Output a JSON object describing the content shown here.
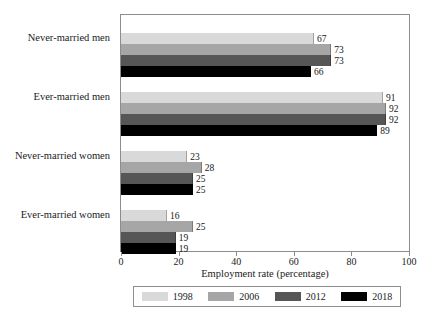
{
  "chart_data": {
    "type": "bar",
    "orientation": "horizontal",
    "title": "",
    "xlabel": "Employment rate (percentage)",
    "ylabel": "",
    "xlim": [
      0,
      100
    ],
    "xticks": [
      0,
      20,
      40,
      60,
      80,
      100
    ],
    "grid": false,
    "legend_position": "bottom",
    "categories": [
      "Never-married men",
      "Ever-married men",
      "Never-married women",
      "Ever-married women"
    ],
    "series": [
      {
        "name": "1998",
        "color": "#d9d9d9",
        "values": [
          67,
          91,
          23,
          16
        ]
      },
      {
        "name": "2006",
        "color": "#a6a6a6",
        "values": [
          73,
          92,
          28,
          25
        ]
      },
      {
        "name": "2012",
        "color": "#565656",
        "values": [
          73,
          92,
          25,
          19
        ]
      },
      {
        "name": "2018",
        "color": "#000000",
        "values": [
          66,
          89,
          25,
          19
        ]
      }
    ]
  },
  "legend": {
    "entries": [
      {
        "label": "1998"
      },
      {
        "label": "2006"
      },
      {
        "label": "2012"
      },
      {
        "label": "2018"
      }
    ]
  },
  "axis": {
    "x_title": "Employment rate (percentage)",
    "x_tick_labels": [
      "0",
      "20",
      "40",
      "60",
      "80",
      "100"
    ]
  }
}
